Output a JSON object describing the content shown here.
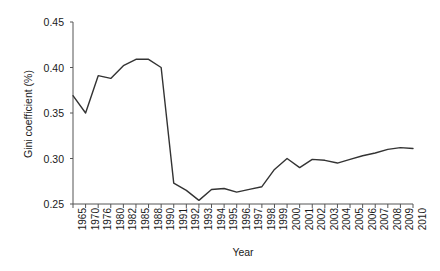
{
  "chart_data": {
    "type": "line",
    "title": "",
    "xlabel": "Year",
    "ylabel": "Gini coefficient (%)",
    "ylim": [
      0.25,
      0.45
    ],
    "yticks": [
      "0.25",
      "0.30",
      "0.35",
      "0.40",
      "0.45"
    ],
    "ytick_values": [
      0.25,
      0.3,
      0.35,
      0.4,
      0.45
    ],
    "grid": false,
    "legend": "none",
    "line_color": "#333333",
    "categories": [
      "1965",
      "1970",
      "1976",
      "1980",
      "1982",
      "1985",
      "1988",
      "1990",
      "1991",
      "1992",
      "1993",
      "1994",
      "1995",
      "1996",
      "1997",
      "1998",
      "1999",
      "2000",
      "2001",
      "2002",
      "2003",
      "2004",
      "2005",
      "2006",
      "2007",
      "2008",
      "2009",
      "2010"
    ],
    "values": [
      0.369,
      0.35,
      0.391,
      0.388,
      0.402,
      0.409,
      0.409,
      0.4,
      0.273,
      0.265,
      0.254,
      0.266,
      0.267,
      0.263,
      0.266,
      0.269,
      0.288,
      0.3,
      0.29,
      0.299,
      0.298,
      0.295,
      0.299,
      0.303,
      0.306,
      0.31,
      0.312,
      0.311
    ]
  }
}
